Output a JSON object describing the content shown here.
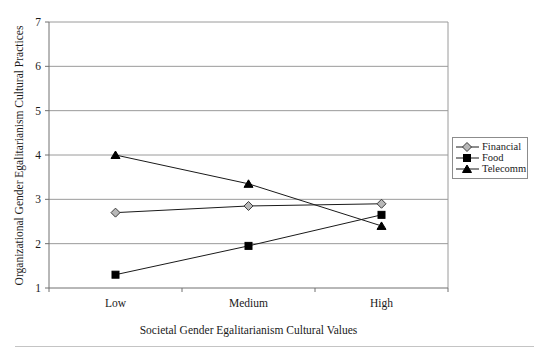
{
  "chart_data": {
    "type": "line",
    "title": "",
    "xlabel": "Societal Gender Egalitarianism Cultural Values",
    "ylabel": "Organizational Gender Egalitarianism Cultural Practices",
    "categories": [
      "Low",
      "Medium",
      "High"
    ],
    "series": [
      {
        "name": "Financial",
        "values": [
          2.7,
          2.85,
          2.9
        ],
        "marker": "diamond",
        "marker_fill": "#b8b8b8",
        "marker_stroke": "#3a3a3a"
      },
      {
        "name": "Food",
        "values": [
          1.3,
          1.95,
          2.65
        ],
        "marker": "square",
        "marker_fill": "#000000",
        "marker_stroke": "#000000"
      },
      {
        "name": "Telecomm",
        "values": [
          4.0,
          3.35,
          2.4
        ],
        "marker": "triangle",
        "marker_fill": "#000000",
        "marker_stroke": "#000000"
      }
    ],
    "ylim": [
      1,
      7
    ],
    "yticks": [
      1,
      2,
      3,
      4,
      5,
      6,
      7
    ],
    "grid": "horizontal",
    "legend_position": "right",
    "colors": {
      "line": "#1a1a1a",
      "grid": "#9a9a9a",
      "axis": "#707070",
      "text": "#1a1a1a",
      "legend_border": "#8c8c8c",
      "rule": "#c4c4c4",
      "background": "#ffffff"
    }
  }
}
